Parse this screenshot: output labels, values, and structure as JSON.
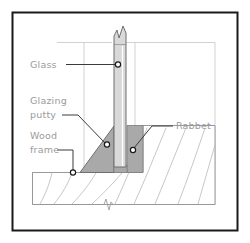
{
  "figure": {
    "frame_border_color": "#1a1a1a",
    "background_color": "#ffffff",
    "label_color": "#9b9b9b",
    "leader_color": "#3a3a3a",
    "glass_fill": "#d9d9d9",
    "putty_fill": "#a9a9a9",
    "rabbet_fill": "#a9a9a9",
    "wood_line_color": "#b9b9b9",
    "guide_line_color": "#c6c6c6"
  },
  "callouts": [
    {
      "id": "glass",
      "label": "Glass",
      "text_x": 30,
      "text_y": 68,
      "marker_x": 118,
      "marker_y": 64
    },
    {
      "id": "glazing-putty",
      "label_line_1": "Glazing",
      "label_line_2": "putty",
      "text_x": 30,
      "text_y": 104,
      "text_y2": 118,
      "marker_x": 107,
      "marker_y": 144
    },
    {
      "id": "rabbet",
      "label": "Rabbet",
      "text_x": 176,
      "text_y": 129,
      "marker_x": 133,
      "marker_y": 150
    },
    {
      "id": "wood-frame",
      "label_line_1": "Wood",
      "label_line_2": "frame",
      "text_x": 30,
      "text_y": 139,
      "text_y2": 153,
      "marker_x": 73,
      "marker_y": 173
    }
  ],
  "break_symbols": {
    "glass_top": "break-line-symbol",
    "wood_bottom": "break-line-symbol"
  }
}
